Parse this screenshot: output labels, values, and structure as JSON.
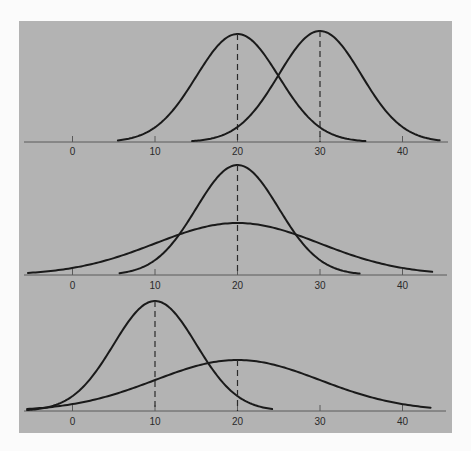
{
  "chart_data": [
    {
      "type": "line",
      "title": "",
      "panel": "top",
      "description": "Two normal distributions with equal spread, different means",
      "xlabel": "",
      "ylabel": "",
      "xlim": [
        -6,
        45
      ],
      "x_ticks": [
        0,
        10,
        20,
        30,
        40
      ],
      "tick_labels": [
        "0",
        "10",
        "20",
        "30",
        "40"
      ],
      "grid": false,
      "legend": null,
      "series": [
        {
          "name": "curve-1",
          "distribution": "normal",
          "mean": 20,
          "sd": 5,
          "relative_peak": 1.0,
          "x_range": [
            5.5,
            35.5
          ],
          "mean_marker": "dashed"
        },
        {
          "name": "curve-2",
          "distribution": "normal",
          "mean": 30,
          "sd": 5,
          "relative_peak": 1.0,
          "x_range": [
            14.5,
            44.5
          ],
          "mean_marker": "dashed"
        }
      ]
    },
    {
      "type": "line",
      "title": "",
      "panel": "middle",
      "description": "Two normal distributions with same mean, different spread",
      "xlabel": "",
      "ylabel": "",
      "xlim": [
        -6,
        45
      ],
      "x_ticks": [
        0,
        10,
        20,
        30,
        40
      ],
      "tick_labels": [
        "0",
        "10",
        "20",
        "30",
        "40"
      ],
      "grid": false,
      "legend": null,
      "series": [
        {
          "name": "curve-narrow",
          "distribution": "normal",
          "mean": 20,
          "sd": 5,
          "relative_peak": 1.0,
          "x_range": [
            5.7,
            34.8
          ],
          "mean_marker": "dashed"
        },
        {
          "name": "curve-wide",
          "distribution": "normal",
          "mean": 20,
          "sd": 10,
          "relative_peak": 0.47,
          "x_range": [
            -5.4,
            43.6
          ],
          "mean_marker": "none"
        }
      ]
    },
    {
      "type": "line",
      "title": "",
      "panel": "bottom",
      "description": "Two normal distributions with different means and different spread",
      "xlabel": "",
      "ylabel": "",
      "xlim": [
        -6,
        45
      ],
      "x_ticks": [
        0,
        10,
        20,
        30,
        40
      ],
      "tick_labels": [
        "0",
        "10",
        "20",
        "30",
        "40"
      ],
      "grid": false,
      "legend": null,
      "series": [
        {
          "name": "curve-narrow",
          "distribution": "normal",
          "mean": 10,
          "sd": 5,
          "relative_peak": 1.0,
          "x_range": [
            -5.5,
            24.2
          ],
          "mean_marker": "dashed"
        },
        {
          "name": "curve-wide",
          "distribution": "normal",
          "mean": 20,
          "sd": 10,
          "relative_peak": 0.46,
          "x_range": [
            -5.5,
            43.4
          ],
          "mean_marker": "dashed"
        }
      ]
    }
  ],
  "layout": {
    "panel_color": "#b3b3b3",
    "line_color": "#1a1a1a",
    "px_per_unit": 8.25,
    "zero_x": 72.5,
    "panels": [
      {
        "axis_y": 142,
        "label_y": 155,
        "axis_x": [
          24,
          448
        ],
        "curves": [
          {
            "peak_y": 34
          },
          {
            "peak_y": 31
          }
        ]
      },
      {
        "axis_y": 275,
        "label_y": 289,
        "axis_x": [
          24,
          447
        ],
        "curves": [
          {
            "peak_y": 165
          },
          {
            "peak_y": 223
          }
        ]
      },
      {
        "axis_y": 411,
        "label_y": 425,
        "axis_x": [
          24,
          446
        ],
        "curves": [
          {
            "peak_y": 301
          },
          {
            "peak_y": 360
          }
        ]
      }
    ]
  }
}
